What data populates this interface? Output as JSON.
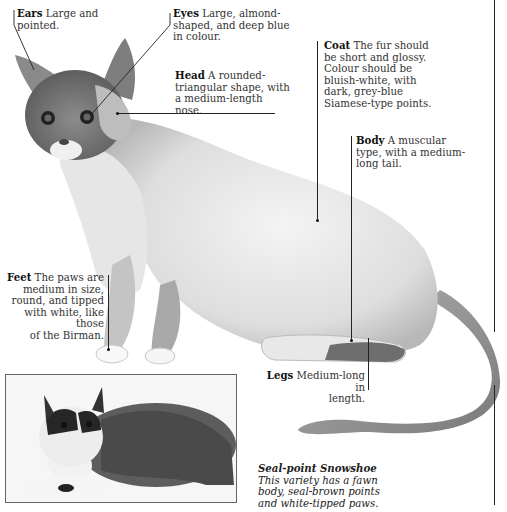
{
  "labels": {
    "ears": {
      "title": "Ears",
      "text_lines": [
        "Large and",
        "pointed."
      ]
    },
    "eyes": {
      "title": "Eyes",
      "text_lines": [
        "Large, almond-",
        "shaped, and deep blue",
        "in colour."
      ]
    },
    "head": {
      "title": "Head",
      "text_lines": [
        "A rounded-",
        "triangular shape, with",
        "a medium-length",
        "nose."
      ]
    },
    "coat": {
      "title": "Coat",
      "text_lines": [
        "The fur should",
        "be short and glossy.",
        "Colour should be",
        "bluish-white, with",
        "dark, grey-blue",
        "Siamese-type points."
      ]
    },
    "body": {
      "title": "Body",
      "text_lines": [
        "A muscular",
        "type, with a medium-",
        "long tail."
      ]
    },
    "feet": {
      "title": "Feet",
      "text_lines": [
        "The paws are",
        "medium in size,",
        "round, and tipped",
        "with white, like those",
        "of the Birman."
      ]
    },
    "legs": {
      "title": "Legs",
      "text_lines": [
        "Medium-long in",
        "length."
      ]
    }
  },
  "caption": {
    "title": "Seal-point Snowshoe",
    "text_lines": [
      "This variety has a fawn",
      "body, seal-brown points",
      "and white-tipped paws."
    ]
  },
  "illustration": {
    "subject": "blue-point Snowshoe cat illustration",
    "photo_subject": "seal-point Snowshoe cat photograph"
  },
  "colors": {
    "line": "#222222",
    "text": "#333333",
    "background": "#ffffff"
  }
}
